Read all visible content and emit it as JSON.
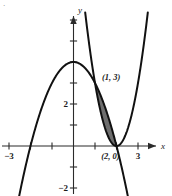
{
  "figure": {
    "corner_mark": "·",
    "background_color": "#ffffff",
    "curve_color": "#111111",
    "axis_color": "#2b2b2b",
    "shade_color": "#6e6e6e"
  },
  "axes": {
    "x_axis_label": "x",
    "y_axis_label": "y",
    "x_ticks": [
      {
        "value": -3,
        "label": "−3",
        "show_label": true
      },
      {
        "value": -2,
        "label": "",
        "show_label": false
      },
      {
        "value": -1,
        "label": "",
        "show_label": false
      },
      {
        "value": 1,
        "label": "",
        "show_label": false
      },
      {
        "value": 2,
        "label": "",
        "show_label": false
      },
      {
        "value": 3,
        "label": "3",
        "show_label": true
      }
    ],
    "y_ticks": [
      {
        "value": -2,
        "label": "−2",
        "show_label": true
      },
      {
        "value": -1,
        "label": "",
        "show_label": false
      },
      {
        "value": 1,
        "label": "",
        "show_label": false
      },
      {
        "value": 2,
        "label": "2",
        "show_label": true
      },
      {
        "value": 3,
        "label": "",
        "show_label": false
      },
      {
        "value": 4,
        "label": "",
        "show_label": false
      },
      {
        "value": 5,
        "label": "",
        "show_label": false
      },
      {
        "value": 6,
        "label": "",
        "show_label": false
      }
    ]
  },
  "annotations": [
    {
      "name": "intersection-label-upper",
      "text": "(1, 3)",
      "x": 1.0,
      "y": 3.0
    },
    {
      "name": "intersection-label-lower",
      "text": "(2, 0)",
      "x": 2.0,
      "y": 0.0
    }
  ],
  "chart_data": {
    "type": "line",
    "title": "",
    "xlabel": "x",
    "ylabel": "y",
    "xlim": [
      -3.6,
      3.9
    ],
    "ylim": [
      -2.6,
      6.3
    ],
    "grid": false,
    "legend": "none",
    "shaded_region": {
      "name": "area-between-curves",
      "between": [
        "downward-parabola",
        "upward-parabola"
      ],
      "x_from": 1.0,
      "x_to": 2.0,
      "fill": "#6e6e6e",
      "vertices": [
        [
          1.0,
          3.0
        ],
        [
          2.0,
          0.0
        ]
      ]
    },
    "series": [
      {
        "name": "downward-parabola",
        "equation": "y = 4 - x^2",
        "type": "parabola",
        "vertex": [
          0,
          4
        ],
        "roots": [
          -2,
          2
        ],
        "x": [
          -2.9,
          -2.5,
          -2.0,
          -1.5,
          -1.0,
          -0.5,
          0.0,
          0.5,
          1.0,
          1.5,
          2.0,
          2.5,
          2.9
        ],
        "values": [
          -4.41,
          -2.25,
          0.0,
          1.75,
          3.0,
          3.75,
          4.0,
          3.75,
          3.0,
          1.75,
          0.0,
          -2.25,
          -4.41
        ]
      },
      {
        "name": "upward-parabola",
        "equation": "y = 3x^2 - 12x + 12",
        "type": "parabola",
        "vertex": [
          2,
          0
        ],
        "roots": [
          2
        ],
        "x": [
          0.6,
          0.8,
          1.0,
          1.2,
          1.4,
          1.6,
          1.8,
          2.0,
          2.2,
          2.4,
          2.6,
          2.8,
          3.0,
          3.4
        ],
        "values": [
          5.88,
          4.32,
          3.0,
          1.92,
          1.08,
          0.48,
          0.12,
          0.0,
          0.12,
          0.48,
          1.08,
          1.92,
          3.0,
          5.88
        ]
      }
    ],
    "intersections": [
      [
        1,
        3
      ],
      [
        2,
        0
      ]
    ]
  }
}
